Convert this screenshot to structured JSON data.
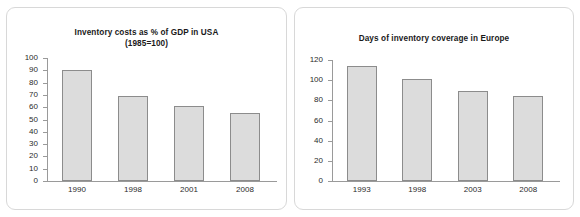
{
  "figure": {
    "background": "#ffffff",
    "panel_border_color": "#d8d8d8",
    "bar_fill_color": "#dcdcdc",
    "bar_border_color": "#8c8c8c",
    "axis_color": "#9a9a9a"
  },
  "chart_data": [
    {
      "type": "bar",
      "title": "Inventory costs as % of GDP in USA\n(1985=100)",
      "categories": [
        "1990",
        "1998",
        "2001",
        "2008"
      ],
      "values": [
        90,
        69,
        61,
        55
      ],
      "xlabel": "",
      "ylabel": "",
      "ylim": [
        0,
        100
      ],
      "yticks": [
        0,
        10,
        20,
        30,
        40,
        50,
        60,
        70,
        80,
        90,
        100
      ],
      "grid": false,
      "legend": "none"
    },
    {
      "type": "bar",
      "title": "Days of inventory coverage in Europe",
      "categories": [
        "1993",
        "1998",
        "2003",
        "2008"
      ],
      "values": [
        114,
        101,
        89,
        84
      ],
      "xlabel": "",
      "ylabel": "",
      "ylim": [
        0,
        120
      ],
      "yticks": [
        0,
        20,
        40,
        60,
        80,
        100,
        120
      ],
      "grid": false,
      "legend": "none"
    }
  ]
}
